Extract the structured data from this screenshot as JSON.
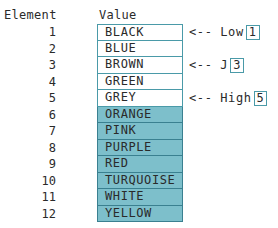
{
  "headers": {
    "element": "Element",
    "value": "Value"
  },
  "rows": [
    {
      "index": "1",
      "value": "BLACK",
      "shaded": false
    },
    {
      "index": "2",
      "value": "BLUE",
      "shaded": false
    },
    {
      "index": "3",
      "value": "BROWN",
      "shaded": false
    },
    {
      "index": "4",
      "value": "GREEN",
      "shaded": false
    },
    {
      "index": "5",
      "value": "GREY",
      "shaded": false
    },
    {
      "index": "6",
      "value": "ORANGE",
      "shaded": true
    },
    {
      "index": "7",
      "value": "PINK",
      "shaded": true
    },
    {
      "index": "8",
      "value": "PURPLE",
      "shaded": true
    },
    {
      "index": "9",
      "value": "RED",
      "shaded": true
    },
    {
      "index": "10",
      "value": "TURQUOISE",
      "shaded": true
    },
    {
      "index": "11",
      "value": "WHITE",
      "shaded": true
    },
    {
      "index": "12",
      "value": "YELLOW",
      "shaded": true
    }
  ],
  "pointers": {
    "low": {
      "arrow": "<-- Low",
      "value": "1",
      "row": 1
    },
    "j": {
      "arrow": "<-- J",
      "value": "3",
      "row": 3
    },
    "high": {
      "arrow": "<-- High",
      "value": "5",
      "row": 5
    }
  },
  "colors": {
    "border": "#4a9aa8",
    "shaded_fill": "#7dbfcb"
  }
}
